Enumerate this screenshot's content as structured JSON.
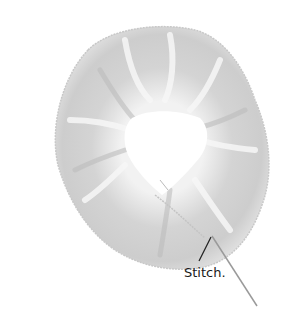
{
  "figure": {
    "colors": {
      "fabric": "#d8d8d8",
      "fabric_shadow": "#bdbdbd",
      "fabric_highlight": "#f4f4f4",
      "center": "#ffffff",
      "thread": "#9a9a9a",
      "leader_line": "#222222"
    }
  },
  "annotations": [
    {
      "text": "Stitch."
    }
  ]
}
